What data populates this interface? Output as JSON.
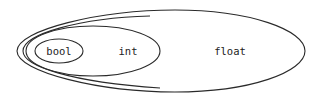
{
  "diagram": {
    "type": "nested-sets",
    "sets": [
      {
        "id": "float",
        "label": "float",
        "contains": [
          "int"
        ]
      },
      {
        "id": "int",
        "label": "int",
        "contains": [
          "bool"
        ]
      },
      {
        "id": "bool",
        "label": "bool",
        "contains": []
      }
    ],
    "colors": {
      "stroke": "#2a2a2a",
      "text": "#222222",
      "background": "#ffffff"
    }
  }
}
